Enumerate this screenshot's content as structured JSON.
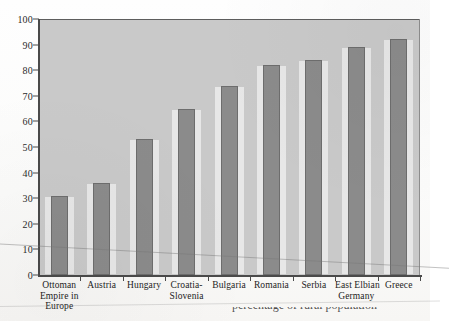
{
  "chart_data": {
    "type": "bar",
    "title": "",
    "xlabel": "",
    "ylabel": "",
    "ylim": [
      0,
      100
    ],
    "yticks": [
      0,
      10,
      20,
      30,
      40,
      50,
      60,
      70,
      80,
      90,
      100
    ],
    "grid": false,
    "legend": "none",
    "categories": [
      "Ottoman Empire in Europe",
      "Austria",
      "Hungary",
      "Croatia-Slovenia",
      "Bulgaria",
      "Romania",
      "Serbia",
      "East Elbian Germany",
      "Greece"
    ],
    "category_lines": [
      [
        "Ottoman",
        "Empire in",
        "Europe"
      ],
      [
        "Austria"
      ],
      [
        "Hungary"
      ],
      [
        "Croatia-",
        "Slovenia"
      ],
      [
        "Bulgaria"
      ],
      [
        "Romania"
      ],
      [
        "Serbia"
      ],
      [
        "East Elbian",
        "Germany"
      ],
      [
        "Greece"
      ]
    ],
    "values": [
      31,
      36,
      53,
      65,
      74,
      82,
      84,
      89,
      92
    ],
    "colors": {
      "bar_fill": "#8b8b8b",
      "bar_stroke": "#6d6d6d",
      "plot_background": "#c9c9c9",
      "axis": "#4a4a4a",
      "text": "#232323",
      "page": "#fdfdfc"
    }
  },
  "caption": {
    "partial_text": "percentage of rural population"
  }
}
